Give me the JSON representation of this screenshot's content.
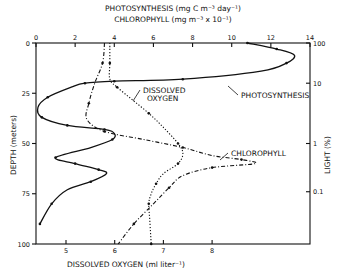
{
  "chart_data": {
    "type": "line",
    "title_top_1": "PHOTOSYNTHESIS (mg C m⁻³ day⁻¹)",
    "title_top_2": "CHLOROPHYLL (mg m⁻³ x 10⁻¹)",
    "xlabel_bottom": "DISSOLVED OXYGEN (ml liter⁻¹)",
    "ylabel_left": "DEPTH (meters)",
    "ylabel_right": "LIGHT (%)",
    "top_axis": {
      "range": [
        0,
        14
      ],
      "ticks": [
        "0",
        "2",
        "4",
        "6",
        "8",
        "10",
        "12",
        "14"
      ]
    },
    "bottom_axis": {
      "range": [
        4.4,
        10.0
      ],
      "ticks": [
        "5",
        "6",
        "7",
        "8"
      ],
      "tick_values": [
        5,
        6,
        7,
        8
      ]
    },
    "left_axis": {
      "range": [
        0,
        100
      ],
      "ticks": [
        "0",
        "25",
        "50",
        "75",
        "100"
      ],
      "tick_values": [
        0,
        25,
        50,
        75,
        100
      ],
      "inverted": true
    },
    "right_axis": {
      "ticks": [
        "100",
        "10",
        "1",
        "0.1"
      ],
      "tick_depths": [
        0,
        20,
        50,
        74
      ]
    },
    "series": [
      {
        "name": "PHOTOSYNTHESIS",
        "axis": "top",
        "style": "solid",
        "depth": [
          0,
          3,
          6,
          10,
          14,
          18,
          19,
          20,
          22,
          27,
          32,
          37,
          41,
          43,
          45,
          48,
          52,
          57,
          60,
          63,
          65,
          69,
          73,
          80,
          90
        ],
        "values": [
          10.8,
          12.3,
          13.2,
          12.8,
          11.5,
          7.5,
          4.0,
          2.5,
          1.8,
          0.6,
          0.1,
          0.3,
          1.6,
          3.5,
          4.0,
          3.9,
          2.8,
          1.0,
          2.0,
          3.2,
          3.6,
          2.8,
          1.6,
          0.8,
          0.2
        ],
        "label": "PHOTOSYNTHESIS"
      },
      {
        "name": "DISSOLVED OXYGEN",
        "axis": "bottom",
        "style": "dotted",
        "depth": [
          0,
          10,
          18,
          22,
          28,
          35,
          42,
          50,
          55,
          60,
          65,
          70,
          75,
          80,
          88,
          100
        ],
        "values": [
          5.9,
          5.9,
          5.9,
          6.05,
          6.35,
          6.7,
          7.0,
          7.3,
          7.4,
          7.3,
          7.0,
          6.85,
          6.75,
          6.7,
          6.72,
          6.75
        ],
        "label": "DISSOLVED OXYGEN"
      },
      {
        "name": "CHLOROPHYLL",
        "axis": "top",
        "style": "dash-dot",
        "depth": [
          0,
          10,
          20,
          30,
          38,
          44,
          48,
          52,
          56,
          58,
          60,
          62,
          66,
          72,
          80,
          90,
          100
        ],
        "values": [
          3.5,
          3.4,
          3.0,
          2.7,
          2.6,
          3.5,
          5.5,
          7.5,
          9.0,
          10.5,
          11.2,
          9.0,
          7.5,
          6.8,
          6.0,
          5.0,
          4.2
        ],
        "label": "CHLOROPHYLL"
      }
    ],
    "grid": false,
    "legend": "inline-labels"
  }
}
